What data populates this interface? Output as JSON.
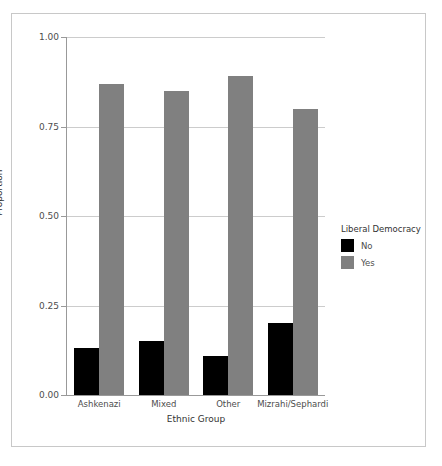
{
  "chart_data": {
    "type": "bar",
    "title": "",
    "xlabel": "Ethnic Group",
    "ylabel": "Proportion",
    "categories": [
      "Ashkenazi",
      "Mixed",
      "Other",
      "Mizrahi/Sephardi"
    ],
    "series": [
      {
        "name": "No",
        "color": "#000000",
        "values": [
          0.13,
          0.15,
          0.11,
          0.2
        ]
      },
      {
        "name": "Yes",
        "color": "#808080",
        "values": [
          0.87,
          0.85,
          0.89,
          0.8
        ]
      }
    ],
    "legend": {
      "title": "Liberal Democracy",
      "position": "right",
      "entries": [
        {
          "label": "No",
          "color": "#000000"
        },
        {
          "label": "Yes",
          "color": "#808080"
        }
      ]
    },
    "ylim": [
      0.0,
      1.0
    ],
    "yticks": [
      {
        "value": 1.0,
        "label": "1.00"
      },
      {
        "value": 0.75,
        "label": "0.75"
      },
      {
        "value": 0.5,
        "label": "0.50"
      },
      {
        "value": 0.25,
        "label": "0.25"
      },
      {
        "value": 0.0,
        "label": "0.00"
      }
    ],
    "grid": {
      "horizontal": true,
      "vertical": false,
      "color": "#cccccc"
    },
    "axis_color": "#999999",
    "background": "#ffffff",
    "frame_color": "#c8c8c8"
  }
}
